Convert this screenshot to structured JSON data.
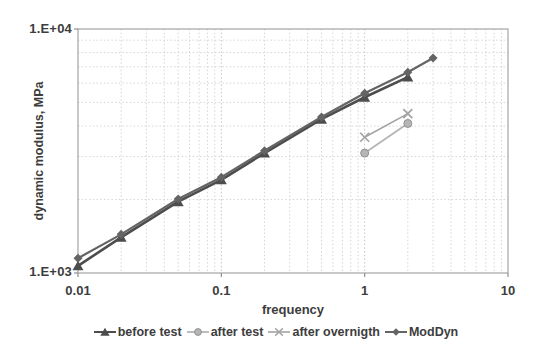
{
  "figure": {
    "background": "#ffffff",
    "text_color": "#3d3d3d"
  },
  "colors": {
    "grid_minor": "#d5d5d5",
    "grid_major": "#c3c3c3",
    "frame": "#a5a5a5",
    "tick": "#8f8f8f"
  },
  "chart_data": {
    "type": "line",
    "title": "",
    "xlabel": "frequency",
    "ylabel": "dynamic modulus, MPa",
    "x_scale": "log",
    "y_scale": "log",
    "xlim": [
      0.01,
      10
    ],
    "ylim": [
      1000,
      10000
    ],
    "x_tick_values": [
      0.01,
      0.1,
      1,
      10
    ],
    "x_tick_labels": [
      "0.01",
      "0.1",
      "1",
      "10"
    ],
    "y_tick_values": [
      1000,
      10000
    ],
    "y_tick_labels": [
      "1.E+03",
      "1.E+04"
    ],
    "grid": "log minor gridlines on, dotted",
    "legend_position": "bottom",
    "series": [
      {
        "name": "before test",
        "marker": "triangle",
        "color": "#4d4d4d",
        "line_width": 2.6,
        "marker_size": 10,
        "x": [
          0.01,
          0.02,
          0.05,
          0.1,
          0.2,
          0.5,
          1,
          2
        ],
        "y": [
          1070,
          1400,
          1960,
          2410,
          3100,
          4270,
          5250,
          6350
        ]
      },
      {
        "name": "after test",
        "marker": "circle",
        "color": "#b5b5b5",
        "marker_edge": "#929292",
        "line_width": 1.8,
        "marker_size": 8,
        "x": [
          1,
          2
        ],
        "y": [
          3100,
          4100
        ]
      },
      {
        "name": "after overnigth",
        "marker": "x",
        "color": "#a3a3a3",
        "line_width": 1.6,
        "marker_size": 9,
        "x": [
          1,
          2
        ],
        "y": [
          3600,
          4500
        ]
      },
      {
        "name": "ModDyn",
        "marker": "diamond",
        "color": "#646464",
        "line_width": 2.2,
        "marker_size": 9,
        "x": [
          0.01,
          0.02,
          0.05,
          0.1,
          0.2,
          0.5,
          1,
          2,
          3
        ],
        "y": [
          1150,
          1440,
          2010,
          2470,
          3170,
          4360,
          5450,
          6650,
          7600
        ]
      }
    ]
  }
}
